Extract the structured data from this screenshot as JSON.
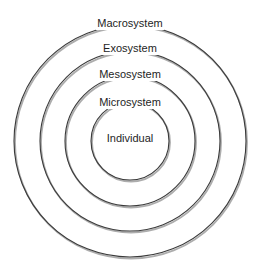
{
  "diagram": {
    "type": "nested-concentric-circles",
    "center": {
      "x": 130,
      "y": 141
    },
    "style": {
      "stroke_color": "#3a3a3a",
      "shadow_color": "#6a6a6a",
      "label_color": "#1e1e1e",
      "background": "#ffffff"
    },
    "layers": [
      {
        "id": "macrosystem",
        "label": "Macrosystem",
        "radius": 116,
        "label_y": 26
      },
      {
        "id": "exosystem",
        "label": "Exosystem",
        "radius": 90,
        "label_y": 51
      },
      {
        "id": "mesosystem",
        "label": "Mesosystem",
        "radius": 65,
        "label_y": 77
      },
      {
        "id": "microsystem",
        "label": "Microsystem",
        "radius": 39,
        "label_y": 105
      },
      {
        "id": "individual",
        "label": "Individual",
        "radius": 0,
        "label_y": 142
      }
    ]
  }
}
